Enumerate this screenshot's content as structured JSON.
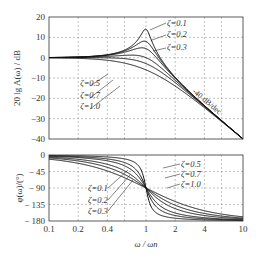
{
  "chart_data": [
    {
      "type": "line",
      "title": "",
      "xlabel": "ω / ωn",
      "ylabel": "20 lg A(ω) / dB",
      "xscale": "log",
      "xlim": [
        0.1,
        10
      ],
      "ylim": [
        -40,
        20
      ],
      "xticks": [
        "0.1",
        "0.2",
        "0.4",
        "1",
        "2",
        "4",
        "10"
      ],
      "yticks": [
        "20",
        "10",
        "0",
        "-10",
        "-20",
        "-30",
        "-40"
      ],
      "grid": true,
      "series": [
        {
          "name": "ζ=0.1",
          "zeta": 0.1
        },
        {
          "name": "ζ=0.2",
          "zeta": 0.2
        },
        {
          "name": "ζ=0.3",
          "zeta": 0.3
        },
        {
          "name": "ζ=0.5",
          "zeta": 0.5
        },
        {
          "name": "ζ=0.7",
          "zeta": 0.7
        },
        {
          "name": "ζ=1.0",
          "zeta": 1.0
        }
      ],
      "annotations": [
        "ζ=0.1",
        "ζ=0.2",
        "ζ=0.3",
        "ζ=0.5",
        "ζ=0.7",
        "ζ=1.0",
        "-40 dB/dec"
      ]
    },
    {
      "type": "line",
      "title": "",
      "xlabel": "ω / ωn",
      "ylabel": "φ(ω)/(°)",
      "xscale": "log",
      "xlim": [
        0.1,
        10
      ],
      "ylim": [
        -180,
        0
      ],
      "xticks": [
        "0.1",
        "0.2",
        "0.4",
        "1",
        "2",
        "4",
        "10"
      ],
      "yticks": [
        "0",
        "-45",
        "-90",
        "-135",
        "-180"
      ],
      "grid": true,
      "series": [
        {
          "name": "ζ=0.1",
          "zeta": 0.1
        },
        {
          "name": "ζ=0.2",
          "zeta": 0.2
        },
        {
          "name": "ζ=0.3",
          "zeta": 0.3
        },
        {
          "name": "ζ=0.5",
          "zeta": 0.5
        },
        {
          "name": "ζ=0.7",
          "zeta": 0.7
        },
        {
          "name": "ζ=1.0",
          "zeta": 1.0
        }
      ],
      "annotations": [
        "ζ=0.1",
        "ζ=0.2",
        "ζ=0.3",
        "ζ=0.5",
        "ζ=0.7",
        "ζ=1.0"
      ]
    }
  ],
  "labels": {
    "mag_ylabel": "20 lg A(ω) / dB",
    "phase_ylabel": "φ(ω)/(°)",
    "xlabel": "ω / ωn",
    "slope": "-40 dB/dec",
    "z01": "ζ=0.1",
    "z02": "ζ=0.2",
    "z03": "ζ=0.3",
    "z05": "ζ=0.5",
    "z07": "ζ=0.7",
    "z10": "ζ=1.0"
  }
}
